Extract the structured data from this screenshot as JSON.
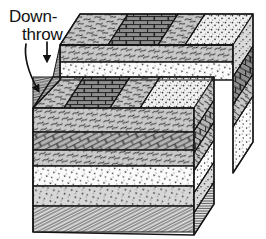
{
  "figure": {
    "kind": "geological-block-diagram",
    "title_visible": false,
    "canvas": {
      "width": 266,
      "height": 239,
      "background": "#ffffff"
    }
  },
  "annotations": {
    "downthrow_label": {
      "line1": "Down-",
      "line2": "throw",
      "color": "#111111",
      "arrows": [
        {
          "name": "long-curved-arrow",
          "from": [
            28,
            44
          ],
          "to": [
            43,
            96
          ],
          "style": "curved"
        },
        {
          "name": "short-straight-arrow",
          "from": [
            47,
            42
          ],
          "to": [
            47,
            64
          ],
          "style": "straight"
        }
      ]
    }
  },
  "ink": {
    "outline": "#1a1a1a",
    "light": "#f2f2f2",
    "mid_light": "#dcdcdc",
    "mid": "#b9b9b9",
    "mid_dark": "#9a9a9a",
    "dark": "#6f6f6f",
    "white": "#ffffff"
  },
  "strata": {
    "legend_note_visible": false,
    "units_top_to_bottom": [
      {
        "id": "u1",
        "pattern": "stipple-coarse",
        "meaning": "sandstone",
        "fill": "#ededed"
      },
      {
        "id": "u2",
        "pattern": "brick-dark",
        "meaning": "limestone",
        "fill": "#8f8f8f"
      },
      {
        "id": "u3",
        "pattern": "wavy-dash",
        "meaning": "shale",
        "fill": "#c9c9c9"
      },
      {
        "id": "u4",
        "pattern": "stipple-fine",
        "meaning": "sandstone",
        "fill": "#f4f4f4"
      },
      {
        "id": "u5",
        "pattern": "brick-light",
        "meaning": "limestone",
        "fill": "#b5b5b5"
      },
      {
        "id": "u6",
        "pattern": "wavy-dash",
        "meaning": "shale",
        "fill": "#c9c9c9"
      },
      {
        "id": "u7",
        "pattern": "stipple-white",
        "meaning": "sandstone",
        "fill": "#fbfbfb"
      },
      {
        "id": "u8",
        "pattern": "stipple-gray",
        "meaning": "sandstone",
        "fill": "#d8d8d8"
      },
      {
        "id": "u9",
        "pattern": "fine-lines",
        "meaning": "laminated-shale",
        "fill": "#dedede"
      }
    ]
  },
  "blocks": [
    {
      "name": "upthrown-block",
      "side": "right",
      "relative_motion": "up"
    },
    {
      "name": "downthrown-block",
      "side": "left",
      "relative_motion": "down"
    }
  ]
}
